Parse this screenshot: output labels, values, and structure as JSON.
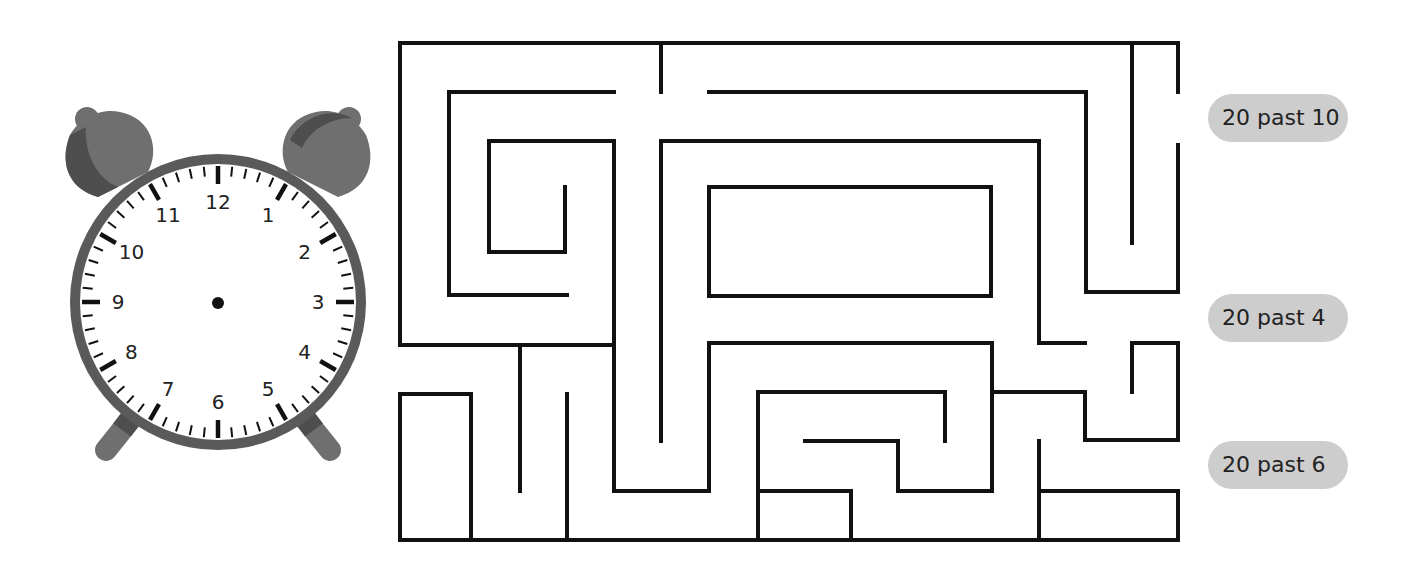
{
  "worksheet": {
    "clock": {
      "numerals": [
        "12",
        "1",
        "2",
        "3",
        "4",
        "5",
        "6",
        "7",
        "8",
        "9",
        "10",
        "11"
      ],
      "hands_shown": false,
      "colors": {
        "rim": "#5a5a5a",
        "bell_dark": "#4e4e4e",
        "bell_light": "#6f6f6f",
        "face": "#ffffff",
        "ticks": "#111111"
      }
    },
    "maze": {
      "wall_color": "#111111",
      "exits": [
        {
          "label": "20 past 10"
        },
        {
          "label": "20 past 4"
        },
        {
          "label": "20 past 6"
        }
      ]
    },
    "labels": [
      "20 past 10",
      "20 past 4",
      "20 past 6"
    ],
    "label_bg": "#cdcdcd"
  }
}
